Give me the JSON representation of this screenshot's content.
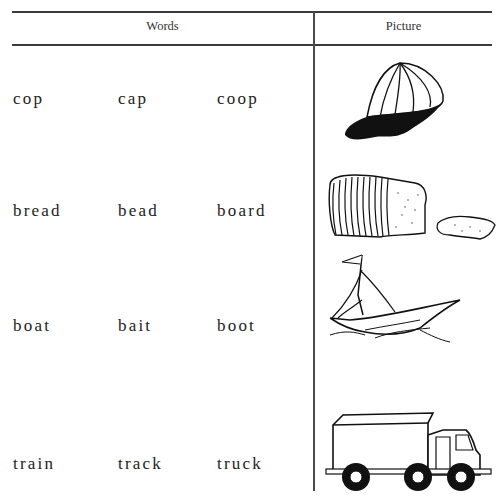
{
  "table": {
    "headers": {
      "words": "Words",
      "picture": "Picture"
    },
    "rows": [
      {
        "words": [
          "cop",
          "cap",
          "coop"
        ],
        "picture": "cap-picture"
      },
      {
        "words": [
          "bread",
          "bead",
          "board"
        ],
        "picture": "bread-picture"
      },
      {
        "words": [
          "boat",
          "bait",
          "boot"
        ],
        "picture": "boat-picture"
      },
      {
        "words": [
          "train",
          "track",
          "truck"
        ],
        "picture": "truck-picture"
      }
    ]
  }
}
